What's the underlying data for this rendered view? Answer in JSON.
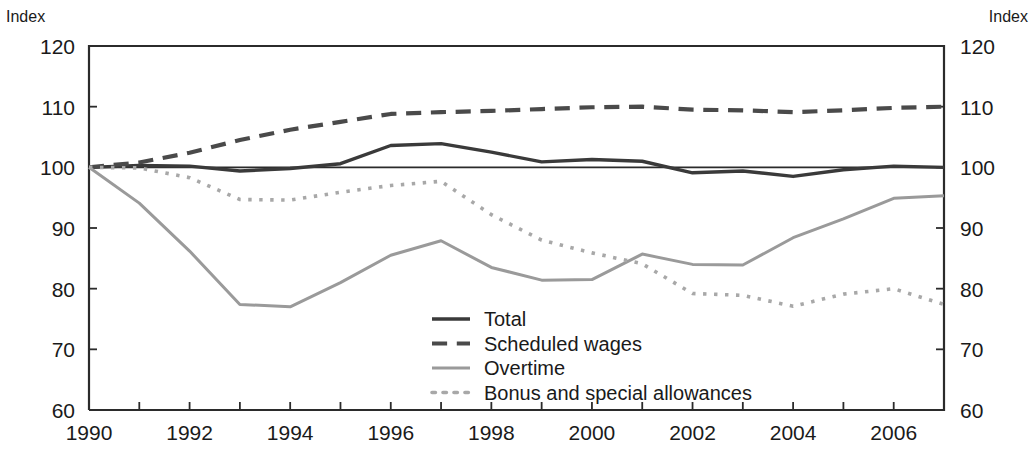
{
  "axis": {
    "unit_label_left": "Index",
    "unit_label_right": "Index",
    "y_ticks": [
      "120",
      "110",
      "100",
      "90",
      "80",
      "70",
      "60"
    ],
    "x_ticks": [
      "1990",
      "1992",
      "1994",
      "1996",
      "1998",
      "2000",
      "2002",
      "2004",
      "2006"
    ]
  },
  "legend": {
    "items": [
      {
        "label": "Total",
        "style": "solid",
        "color": "#3a3a3a"
      },
      {
        "label": "Scheduled wages",
        "style": "dash-dot",
        "color": "#4a4a4a"
      },
      {
        "label": "Overtime",
        "style": "solid",
        "color": "#9a9a9a"
      },
      {
        "label": "Bonus and special allowances",
        "style": "dotted",
        "color": "#a8a8a8"
      }
    ]
  },
  "chart_data": {
    "type": "line",
    "title": "",
    "subtitle": "",
    "xlabel": "",
    "ylabel": "Index",
    "xlim": [
      1990,
      2007
    ],
    "ylim": [
      60,
      120
    ],
    "grid": false,
    "legend_position": "center-bottom-inside",
    "reference_line": 100,
    "x": [
      1990,
      1991,
      1992,
      1993,
      1994,
      1995,
      1996,
      1997,
      1998,
      1999,
      2000,
      2001,
      2002,
      2003,
      2004,
      2005,
      2006,
      2007
    ],
    "x_tick_labels": [
      "1990",
      "1992",
      "1994",
      "1996",
      "1998",
      "2000",
      "2002",
      "2004",
      "2006"
    ],
    "y_tick_labels": [
      "60",
      "70",
      "80",
      "90",
      "100",
      "110",
      "120"
    ],
    "series": [
      {
        "name": "Total",
        "color": "#3a3a3a",
        "style": "solid",
        "values": [
          100.0,
          100.3,
          100.2,
          99.4,
          99.8,
          100.6,
          103.6,
          103.9,
          102.5,
          100.9,
          101.3,
          101.0,
          99.1,
          99.4,
          98.5,
          99.6,
          100.2,
          100.0
        ]
      },
      {
        "name": "Scheduled wages",
        "color": "#4a4a4a",
        "style": "dash-dot",
        "values": [
          100.0,
          100.8,
          102.4,
          104.5,
          106.2,
          107.5,
          108.8,
          109.1,
          109.3,
          109.6,
          109.9,
          110.0,
          109.5,
          109.4,
          109.1,
          109.4,
          109.8,
          110.0
        ]
      },
      {
        "name": "Overtime",
        "color": "#9a9a9a",
        "style": "solid",
        "values": [
          100.0,
          94.1,
          86.2,
          77.4,
          77.0,
          81.0,
          85.5,
          87.9,
          83.5,
          81.4,
          81.5,
          85.7,
          84.0,
          83.9,
          88.4,
          91.5,
          94.9,
          95.3
        ]
      },
      {
        "name": "Bonus and special allowances",
        "color": "#a8a8a8",
        "style": "dotted",
        "values": [
          100.0,
          99.9,
          98.3,
          94.7,
          94.6,
          95.9,
          97.0,
          97.7,
          92.2,
          88.0,
          85.9,
          84.1,
          79.2,
          78.9,
          77.1,
          79.1,
          80.0,
          77.4
        ]
      }
    ]
  }
}
